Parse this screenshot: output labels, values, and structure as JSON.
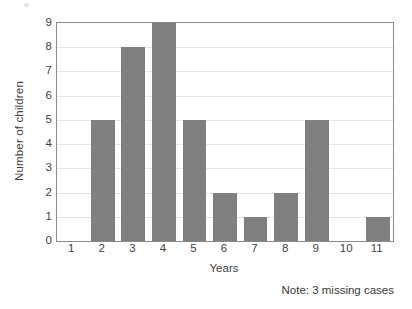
{
  "chart_data": {
    "type": "bar",
    "title": "",
    "xlabel": "Years",
    "ylabel": "Number of children",
    "categories": [
      "1",
      "2",
      "3",
      "4",
      "5",
      "6",
      "7",
      "8",
      "9",
      "10",
      "11"
    ],
    "values": [
      0,
      5,
      8,
      9,
      5,
      2,
      1,
      2,
      5,
      0,
      1
    ],
    "ylim": [
      0,
      9
    ],
    "yticks": [
      "0",
      "1",
      "2",
      "3",
      "4",
      "5",
      "6",
      "7",
      "8",
      "9"
    ],
    "grid": true,
    "legend": false,
    "bar_color": "#808080",
    "gridline_color": "#e3e3e3",
    "axis_color": "#8a8a8a",
    "background_color": "#ffffff",
    "annotations": [
      {
        "name": "missing-cases-note",
        "text": "Note: 3 missing cases"
      }
    ]
  },
  "note": {
    "text": "Note: 3 missing cases"
  }
}
